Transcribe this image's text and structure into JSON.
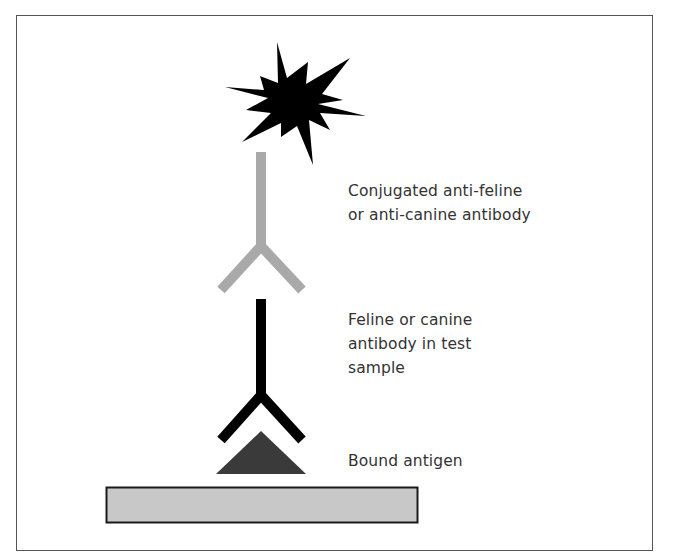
{
  "diagram": {
    "type": "ELISA antibody detection schematic",
    "labels": {
      "conjugated_antibody": "Conjugated anti-feline\nor anti-canine antibody",
      "sample_antibody": "Feline or canine\nantibody in test\nsample",
      "bound_antigen": "Bound antigen"
    },
    "components": [
      {
        "id": "enzyme-signal",
        "shape": "starburst",
        "color": "#000000"
      },
      {
        "id": "conjugated-antibody",
        "shape": "Y",
        "color": "#a9a9a9"
      },
      {
        "id": "sample-antibody",
        "shape": "Y",
        "color": "#000000"
      },
      {
        "id": "antigen",
        "shape": "triangle",
        "color": "#3a3a3a"
      },
      {
        "id": "solid-phase",
        "shape": "rectangle",
        "color": "#c8c8c8"
      }
    ],
    "colors": {
      "frame_border": "#555555",
      "text": "#333333",
      "gray_antibody": "#a9a9a9",
      "black_antibody": "#000000",
      "antigen": "#3a3a3a",
      "plate_fill": "#c8c8c8",
      "plate_border": "#1a1a1a"
    }
  }
}
